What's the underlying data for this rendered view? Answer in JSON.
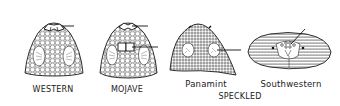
{
  "diagram": {
    "heads": [
      {
        "id": "western",
        "label": "WESTERN",
        "view": "dorsal",
        "pointers": 1
      },
      {
        "id": "mojave",
        "label": "MOJAVE",
        "view": "dorsal",
        "pointers": 2
      },
      {
        "id": "panamint",
        "label": "Panamint",
        "view": "dorsal",
        "pointers": 1
      },
      {
        "id": "southwestern",
        "label": "Southwestern",
        "view": "frontal",
        "pointers": 1
      }
    ],
    "group_label": "SPECKLED",
    "colors": {
      "ink": "#1a1a1a",
      "background": "#ffffff"
    }
  }
}
